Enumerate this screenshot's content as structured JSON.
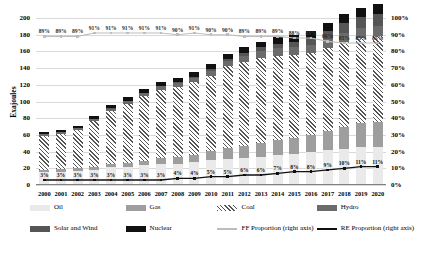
{
  "chart_data": {
    "type": "bar",
    "title": "",
    "xlabel": "",
    "ylabel": "Exajoules",
    "ylim": [
      0,
      200
    ],
    "y2lim": [
      0,
      100
    ],
    "y2label": "",
    "grid": true,
    "legend_position": "bottom",
    "categories": [
      "2000",
      "2001",
      "2002",
      "2003",
      "2004",
      "2005",
      "2006",
      "2007",
      "2008",
      "2009",
      "2010",
      "2011",
      "2012",
      "2013",
      "2014",
      "2015",
      "2016",
      "2017",
      "2018",
      "2019",
      "2020"
    ],
    "y_ticks": [
      0,
      20,
      40,
      60,
      80,
      100,
      120,
      140,
      160,
      180,
      200
    ],
    "y2_ticks": [
      "0%",
      "10%",
      "20%",
      "30%",
      "40%",
      "50%",
      "60%",
      "70%",
      "80%",
      "90%",
      "100%"
    ],
    "series": [
      {
        "name": "Oil",
        "axis": "left",
        "kind": "bar",
        "values": [
          15.5,
          16.0,
          17.0,
          18.5,
          21.0,
          22.0,
          23.5,
          25.0,
          25.5,
          27.0,
          29.5,
          31.0,
          32.5,
          34.0,
          35.5,
          37.5,
          39.5,
          41.5,
          43.5,
          45.0,
          45.0
        ]
      },
      {
        "name": "Gas",
        "axis": "left",
        "kind": "bar",
        "values": [
          2.5,
          2.8,
          3.0,
          3.4,
          4.0,
          4.8,
          5.8,
          7.0,
          8.0,
          9.0,
          11.0,
          13.0,
          14.5,
          16.5,
          18.0,
          19.0,
          20.5,
          23.0,
          26.5,
          29.0,
          30.5
        ]
      },
      {
        "name": "Coal",
        "axis": "left",
        "kind": "bar",
        "values": [
          41.0,
          42.5,
          46.0,
          55.0,
          63.5,
          70.5,
          77.0,
          82.0,
          84.0,
          87.0,
          90.0,
          98.0,
          100.5,
          102.0,
          101.0,
          99.0,
          98.0,
          99.5,
          101.5,
          102.5,
          103.0
        ]
      },
      {
        "name": "Hydro",
        "axis": "left",
        "kind": "bar",
        "values": [
          2.3,
          2.5,
          2.6,
          2.6,
          3.0,
          3.4,
          3.8,
          4.2,
          5.0,
          5.3,
          6.2,
          6.1,
          7.6,
          8.2,
          9.3,
          9.5,
          10.1,
          10.5,
          10.8,
          11.3,
          11.7
        ]
      },
      {
        "name": "Solar and Wind",
        "axis": "left",
        "kind": "bar",
        "values": [
          0.1,
          0.1,
          0.1,
          0.2,
          0.2,
          0.3,
          0.4,
          0.6,
          1.0,
          1.5,
          2.0,
          2.8,
          3.4,
          4.4,
          5.6,
          6.7,
          7.7,
          9.5,
          11.5,
          13.0,
          14.5
        ]
      },
      {
        "name": "Nuclear",
        "axis": "left",
        "kind": "bar",
        "values": [
          1.6,
          1.8,
          2.5,
          3.0,
          3.6,
          4.2,
          4.6,
          5.2,
          5.3,
          5.6,
          6.0,
          6.2,
          6.4,
          6.8,
          7.6,
          8.0,
          8.6,
          9.5,
          10.5,
          11.5,
          12.0
        ]
      },
      {
        "name": "FF Proportion (right axis)",
        "axis": "right",
        "kind": "line",
        "values": [
          89,
          89,
          89,
          91,
          91,
          91,
          91,
          91,
          90,
          91,
          90,
          90,
          89,
          89,
          89,
          88,
          88,
          86,
          85,
          85,
          85
        ],
        "labels": [
          "89%",
          "89%",
          "89%",
          "91%",
          "91%",
          "91%",
          "91%",
          "91%",
          "90%",
          "91%",
          "90%",
          "90%",
          "89%",
          "89%",
          "89%",
          "88%",
          "88%",
          "86%",
          "85%",
          "85%",
          "85%"
        ]
      },
      {
        "name": "RE Proportion (right axis)",
        "axis": "right",
        "kind": "line",
        "values": [
          3,
          3,
          3,
          3,
          3,
          3,
          3,
          3,
          4,
          4,
          5,
          5,
          6,
          6,
          7,
          8,
          8,
          9,
          10,
          11,
          11
        ],
        "labels": [
          "3%",
          "3%",
          "3%",
          "3%",
          "3%",
          "3%",
          "3%",
          "3%",
          "4%",
          "4%",
          "5%",
          "5%",
          "6%",
          "6%",
          "7%",
          "8%",
          "8%",
          "9%",
          "10%",
          "11%",
          "11%"
        ]
      }
    ],
    "colors": {
      "oil": "#eaeaea",
      "gas": "#9e9e9e",
      "coal": "#555555",
      "hydro": "#6b6b6b",
      "solar_and_wind": "#565656",
      "nuclear": "#111111",
      "ff_line": "#bdbdbd",
      "re_line": "#111111",
      "gridline": "#d9d9d9"
    }
  },
  "legend": {
    "items": [
      {
        "label": "Oil",
        "swatch": "oil",
        "style": "block"
      },
      {
        "label": "Gas",
        "swatch": "gas",
        "style": "block"
      },
      {
        "label": "Coal",
        "swatch": "coal",
        "style": "block"
      },
      {
        "label": "Hydro",
        "swatch": "hydro",
        "style": "block"
      },
      {
        "label": "Solar and Wind",
        "swatch": "solarwind",
        "style": "block"
      },
      {
        "label": "Nuclear",
        "swatch": "nuclear",
        "style": "block"
      },
      {
        "label": "FF Proportion (right axis)",
        "swatch": "ff",
        "style": "line"
      },
      {
        "label": "RE Proportion (right axis)",
        "swatch": "re",
        "style": "line"
      }
    ]
  }
}
